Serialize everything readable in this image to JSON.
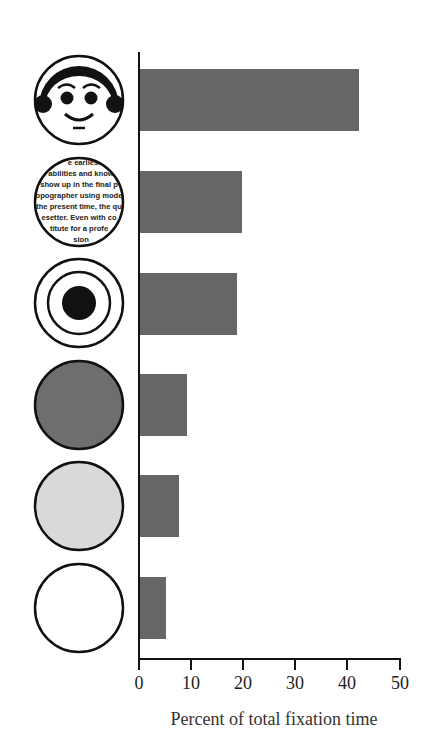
{
  "chart_data": {
    "type": "bar",
    "orientation": "horizontal",
    "title": "",
    "xlabel": "Percent of total fixation time",
    "ylabel": "",
    "xlim": [
      0,
      50
    ],
    "x_ticks": [
      "0",
      "10",
      "20",
      "30",
      "40",
      "50"
    ],
    "grid": false,
    "legend": null,
    "categories": [
      "face",
      "text",
      "concentric-circles",
      "dark-gray-disc",
      "light-gray-disc",
      "white-disc"
    ],
    "values": [
      42,
      19.5,
      18.5,
      9,
      7.5,
      5
    ],
    "bar_color": "#666666",
    "category_icon_text": [
      "e earlies",
      "abilities and know",
      "show up in the final p",
      "opographer using mode",
      "the present time, the qu",
      "esetter. Even with co",
      "titute for a profe",
      "sion"
    ]
  },
  "axis": {
    "title": "Percent of total fixation time",
    "ticks": [
      "0",
      "10",
      "20",
      "30",
      "40",
      "50"
    ]
  },
  "colors": {
    "bar": "#666666",
    "dark_disc": "#6e6e6e",
    "light_disc": "#d9d9d9",
    "outline": "#111111"
  }
}
